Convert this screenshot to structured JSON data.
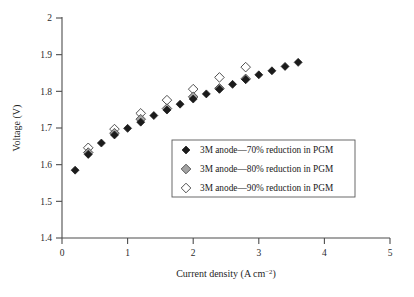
{
  "chart_data": {
    "type": "scatter",
    "title": "",
    "xlabel": "Current density (A cm−2)",
    "ylabel": "Voltage (V)",
    "xlim": [
      0,
      5
    ],
    "ylim": [
      1.4,
      2.0
    ],
    "xticks": [
      "0",
      "1",
      "2",
      "3",
      "4",
      "5"
    ],
    "yticks": [
      "1.4",
      "1.5",
      "1.6",
      "1.7",
      "1.8",
      "1.9",
      "2"
    ],
    "grid": false,
    "legend_position": "inside-center-right",
    "series": [
      {
        "name": "3M anode—70% reduction in PGM",
        "marker": "filled-diamond",
        "color": "#1b1b1b",
        "points": [
          [
            0.2,
            1.585
          ],
          [
            0.4,
            1.628
          ],
          [
            0.6,
            1.659
          ],
          [
            0.8,
            1.681
          ],
          [
            1.0,
            1.699
          ],
          [
            1.2,
            1.716
          ],
          [
            1.4,
            1.734
          ],
          [
            1.6,
            1.749
          ],
          [
            1.8,
            1.765
          ],
          [
            2.0,
            1.779
          ],
          [
            2.2,
            1.793
          ],
          [
            2.4,
            1.806
          ],
          [
            2.6,
            1.819
          ],
          [
            2.8,
            1.832
          ],
          [
            3.0,
            1.845
          ],
          [
            3.2,
            1.856
          ],
          [
            3.4,
            1.868
          ],
          [
            3.6,
            1.879
          ]
        ]
      },
      {
        "name": "3M anode—80% reduction in PGM",
        "marker": "gray-diamond",
        "color": "#a3a3a3",
        "points": [
          [
            0.4,
            1.633
          ],
          [
            0.8,
            1.686
          ],
          [
            1.2,
            1.724
          ],
          [
            1.6,
            1.753
          ],
          [
            2.0,
            1.785
          ],
          [
            2.4,
            1.808
          ],
          [
            2.8,
            1.834
          ]
        ]
      },
      {
        "name": "3M anode—90% reduction in PGM",
        "marker": "hollow-diamond",
        "color": "#ffffff",
        "points": [
          [
            0.4,
            1.646
          ],
          [
            0.8,
            1.697
          ],
          [
            1.2,
            1.74
          ],
          [
            1.6,
            1.776
          ],
          [
            2.0,
            1.806
          ],
          [
            2.4,
            1.838
          ],
          [
            2.8,
            1.866
          ]
        ]
      }
    ]
  },
  "legend": {
    "entries": [
      "3M anode—70% reduction in PGM",
      "3M anode—80% reduction in PGM",
      "3M anode—90% reduction in PGM"
    ]
  },
  "axis": {
    "x_title_main": "Current density (A cm",
    "x_title_sup": "−2",
    "x_title_end": ")",
    "y_title": "Voltage (V)"
  }
}
